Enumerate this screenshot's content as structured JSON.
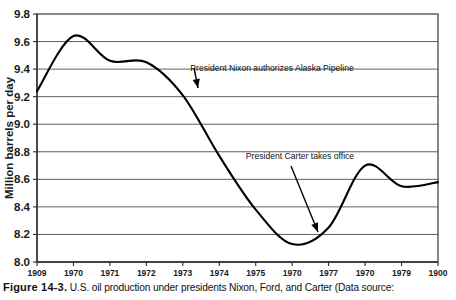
{
  "figure": {
    "caption_label": "Figure 14-3.",
    "caption_text": "U.S. oil production under presidents Nixon, Ford, and Carter (Data source:"
  },
  "chart_data": {
    "type": "line",
    "title": "",
    "xlabel": "",
    "ylabel": "Million barrels per day",
    "ylim": [
      8.0,
      9.8
    ],
    "ytick_step": 0.2,
    "yticks": [
      "9.8",
      "9.6",
      "9.4",
      "9.2",
      "9.0",
      "8.8",
      "8.6",
      "8.4",
      "8.2",
      "8.0"
    ],
    "ytick_values": [
      9.8,
      9.6,
      9.4,
      9.2,
      9.0,
      8.8,
      8.6,
      8.4,
      8.2,
      8.0
    ],
    "grid": true,
    "legend": "none",
    "categories": [
      "1909",
      "1970",
      "1971",
      "1972",
      "1973",
      "1974",
      "1975",
      "1970",
      "1977",
      "1970",
      "1979",
      "1900"
    ],
    "x": [
      1969,
      1970,
      1971,
      1972,
      1973,
      1974,
      1975,
      1976,
      1977,
      1978,
      1979,
      1980
    ],
    "series": [
      {
        "name": "U.S. oil production",
        "values": [
          9.24,
          9.64,
          9.46,
          9.45,
          9.21,
          8.77,
          8.38,
          8.13,
          8.25,
          8.7,
          8.55,
          8.58
        ]
      }
    ],
    "annotations": [
      {
        "text": "President Nixon authorizes Alaska Pipeline",
        "target_x": 1973.0,
        "target_y": 9.18
      },
      {
        "text": "President Carter takes office",
        "target_x": 1977.0,
        "target_y": 8.19
      }
    ]
  }
}
